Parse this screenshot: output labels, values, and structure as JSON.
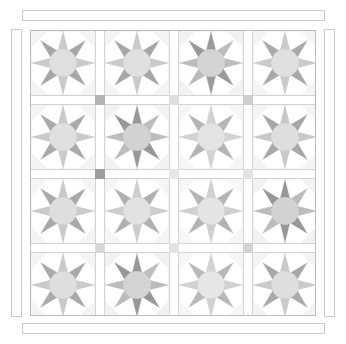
{
  "title": "Eight-Pointed Star Sampler Quilt Layout Diagram",
  "palette": {
    "background": "#ffffff",
    "outline": "#bdbdbd",
    "block_outline": "#d0d0d0",
    "sashing": "#ffffff",
    "sashing_line": "#d4d4d4",
    "border_line": "#c9c9c9",
    "light": "#d8d8d8",
    "medium": "#bdbdbd",
    "dark": "#a8a8a8",
    "darker": "#9a9a9a",
    "center": "#dcdcdc",
    "corner_light": "#f2f2f2"
  },
  "layout": {
    "rows": 4,
    "columns": 4,
    "block_count": 16,
    "body": {
      "x": 30,
      "y": 30,
      "width": 286,
      "height": 286
    },
    "block_size": 64,
    "sash_width": 10,
    "cornerstone_size": 10
  },
  "borders": [
    {
      "name": "top-border-strip",
      "x": 22,
      "y": 10,
      "width": 303,
      "height": 11
    },
    {
      "name": "bottom-border-strip",
      "x": 22,
      "y": 323,
      "width": 303,
      "height": 11
    },
    {
      "name": "left-border-strip",
      "x": 11,
      "y": 29,
      "width": 11,
      "height": 288
    },
    {
      "name": "right-border-strip",
      "x": 324,
      "y": 29,
      "width": 11,
      "height": 288
    }
  ],
  "blocks": [
    {
      "row": 1,
      "col": 1,
      "name": "star-block-r1c1",
      "pattern": "eight-point-star",
      "tone": "light",
      "accent": "none",
      "star_color": "#cacaca",
      "accent_color": "#a6a6a6",
      "center_color": "#dfdfdf",
      "corner_color": "#f4f4f4"
    },
    {
      "row": 1,
      "col": 2,
      "name": "star-block-r1c2",
      "pattern": "eight-point-star",
      "tone": "light",
      "accent": "none",
      "star_color": "#cacaca",
      "accent_color": "#a6a6a6",
      "center_color": "#e0e0e0",
      "corner_color": "#f4f4f4"
    },
    {
      "row": 1,
      "col": 3,
      "name": "star-block-r1c3",
      "pattern": "eight-point-star",
      "tone": "dark",
      "accent": "diagonal-nw",
      "star_color": "#bcbcbc",
      "accent_color": "#9a9a9a",
      "center_color": "#d4d4d4",
      "corner_color": "#f2f2f2"
    },
    {
      "row": 1,
      "col": 4,
      "name": "star-block-r1c4",
      "pattern": "eight-point-star",
      "tone": "light",
      "accent": "none",
      "star_color": "#cacaca",
      "accent_color": "#a9a9a9",
      "center_color": "#e0e0e0",
      "corner_color": "#f4f4f4"
    },
    {
      "row": 2,
      "col": 1,
      "name": "star-block-r2c1",
      "pattern": "eight-point-star",
      "tone": "light",
      "accent": "none",
      "star_color": "#cacaca",
      "accent_color": "#a9a9a9",
      "center_color": "#e0e0e0",
      "corner_color": "#f4f4f4"
    },
    {
      "row": 2,
      "col": 2,
      "name": "star-block-r2c2",
      "pattern": "eight-point-star",
      "tone": "dark",
      "accent": "diagonal-nw",
      "star_color": "#bdbdbd",
      "accent_color": "#979797",
      "center_color": "#d2d2d2",
      "corner_color": "#f2f2f2"
    },
    {
      "row": 2,
      "col": 3,
      "name": "star-block-r2c3",
      "pattern": "eight-point-star",
      "tone": "light",
      "accent": "none",
      "star_color": "#d2d2d2",
      "accent_color": "#b4b4b4",
      "center_color": "#e4e4e4",
      "corner_color": "#f6f6f6"
    },
    {
      "row": 2,
      "col": 4,
      "name": "star-block-r2c4",
      "pattern": "eight-point-star",
      "tone": "light",
      "accent": "none",
      "star_color": "#c8c8c8",
      "accent_color": "#a6a6a6",
      "center_color": "#dedede",
      "corner_color": "#f4f4f4"
    },
    {
      "row": 3,
      "col": 1,
      "name": "star-block-r3c1",
      "pattern": "eight-point-star",
      "tone": "light",
      "accent": "none",
      "star_color": "#cacaca",
      "accent_color": "#a9a9a9",
      "center_color": "#dedede",
      "corner_color": "#f4f4f4"
    },
    {
      "row": 3,
      "col": 2,
      "name": "star-block-r3c2",
      "pattern": "eight-point-star",
      "tone": "light",
      "accent": "none",
      "star_color": "#cdcdcd",
      "accent_color": "#b0b0b0",
      "center_color": "#e2e2e2",
      "corner_color": "#f5f5f5"
    },
    {
      "row": 3,
      "col": 3,
      "name": "star-block-r3c3",
      "pattern": "eight-point-star",
      "tone": "light",
      "accent": "none",
      "star_color": "#d0d0d0",
      "accent_color": "#b4b4b4",
      "center_color": "#e4e4e4",
      "corner_color": "#f6f6f6"
    },
    {
      "row": 3,
      "col": 4,
      "name": "star-block-r3c4",
      "pattern": "eight-point-star",
      "tone": "dark",
      "accent": "diagonal-nw",
      "star_color": "#bcbcbc",
      "accent_color": "#979797",
      "center_color": "#d2d2d2",
      "corner_color": "#f2f2f2"
    },
    {
      "row": 4,
      "col": 1,
      "name": "star-block-r4c1",
      "pattern": "eight-point-star",
      "tone": "light",
      "accent": "none",
      "star_color": "#cacaca",
      "accent_color": "#a9a9a9",
      "center_color": "#dedede",
      "corner_color": "#f4f4f4"
    },
    {
      "row": 4,
      "col": 2,
      "name": "star-block-r4c2",
      "pattern": "eight-point-star",
      "tone": "dark",
      "accent": "diagonal-nw",
      "star_color": "#bcbcbc",
      "accent_color": "#979797",
      "center_color": "#d4d4d4",
      "corner_color": "#f2f2f2"
    },
    {
      "row": 4,
      "col": 3,
      "name": "star-block-r4c3",
      "pattern": "eight-point-star",
      "tone": "light",
      "accent": "none",
      "star_color": "#d2d2d2",
      "accent_color": "#b8b8b8",
      "center_color": "#e6e6e6",
      "corner_color": "#f6f6f6"
    },
    {
      "row": 4,
      "col": 4,
      "name": "star-block-r4c4",
      "pattern": "eight-point-star",
      "tone": "light",
      "accent": "none",
      "star_color": "#cacaca",
      "accent_color": "#a9a9a9",
      "center_color": "#dedede",
      "corner_color": "#f4f4f4"
    }
  ],
  "cornerstones": [
    {
      "row": 1,
      "col": 1,
      "name": "cornerstone-r1c1",
      "color": "#b4b4b4"
    },
    {
      "row": 1,
      "col": 2,
      "name": "cornerstone-r1c2",
      "color": "#dedede"
    },
    {
      "row": 1,
      "col": 3,
      "name": "cornerstone-r1c3",
      "color": "#cdcdcd"
    },
    {
      "row": 2,
      "col": 1,
      "name": "cornerstone-r2c1",
      "color": "#9e9e9e"
    },
    {
      "row": 2,
      "col": 2,
      "name": "cornerstone-r2c2",
      "color": "#e6e6e6"
    },
    {
      "row": 2,
      "col": 3,
      "name": "cornerstone-r2c3",
      "color": "#e2e2e2"
    },
    {
      "row": 3,
      "col": 1,
      "name": "cornerstone-r3c1",
      "color": "#d6d6d6"
    },
    {
      "row": 3,
      "col": 2,
      "name": "cornerstone-r3c2",
      "color": "#e2e2e2"
    },
    {
      "row": 3,
      "col": 3,
      "name": "cornerstone-r3c3",
      "color": "#d2d2d2"
    }
  ]
}
